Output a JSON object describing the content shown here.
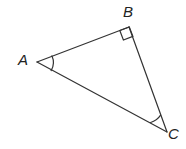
{
  "figure": {
    "name": "right-triangle-abc",
    "type": "geometry-diagram",
    "background_color": "#ffffff",
    "stroke_color": "#333333",
    "stroke_width": 1.2,
    "width": 186,
    "height": 149
  },
  "labels": {
    "a": "A",
    "b": "B",
    "c": "C"
  },
  "vertices": {
    "A": {
      "x": 37,
      "y": 62
    },
    "B": {
      "x": 129,
      "y": 27
    },
    "C": {
      "x": 167,
      "y": 132
    }
  },
  "edges": [
    {
      "name": "segment-AB",
      "from": "A",
      "to": "B",
      "path": "M 37 62 L 129 27"
    },
    {
      "name": "segment-BC",
      "from": "B",
      "to": "C",
      "path": "M 129 27 L 167 132"
    },
    {
      "name": "segment-AC",
      "from": "A",
      "to": "C",
      "path": "M 37 62 L 167 132"
    }
  ],
  "angle_marks": {
    "angle_A": {
      "name": "angle-arc-a",
      "type": "arc",
      "vertex": "A",
      "radius": 16,
      "path": "M 52.0 55.9 A 16 16 0 0 1 51.1 70.6"
    },
    "angle_B": {
      "name": "right-angle-square-b",
      "type": "right-angle-square",
      "vertex": "B",
      "size": 10,
      "path": "M 119.8 30.5 L 123.4 40.0 L 132.9 36.4 L 129.3 26.9 Z"
    },
    "angle_C": {
      "name": "angle-arc-c",
      "type": "arc",
      "vertex": "C",
      "radius": 18,
      "path": "M 160.6 115.2 A 18 18 0 0 1 150.6 122.5"
    }
  }
}
